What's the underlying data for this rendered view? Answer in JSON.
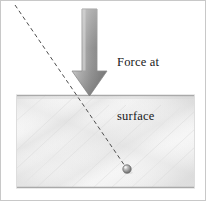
{
  "figure": {
    "width": 201,
    "height": 201,
    "background_color": "#ffffff",
    "border_color": "#c8c8c8"
  },
  "labels": {
    "force_label_line1": "Force at",
    "force_label_line2": "surface",
    "force_label_full": "Force at surface",
    "text_color": "#18181a"
  },
  "arrow": {
    "name": "force-arrow",
    "direction": "down",
    "color_light": "#b8b8b8",
    "color_dark": "#6e6e6e",
    "outline_color": "#8a8a8a",
    "shaft_left": 81,
    "shaft_right": 96,
    "shaft_top": 8,
    "head_top": 70,
    "head_left": 71,
    "head_right": 106,
    "tip_x": 88.5,
    "tip_y": 95
  },
  "block": {
    "name": "material-block",
    "left": 15,
    "top": 94,
    "right": 194,
    "bottom": 187,
    "fill_light": "#fbfbfb",
    "fill_mid": "#ececec",
    "fill_shadow": "#e0e0e0",
    "edge_color": "#a9a9a9",
    "surface_label": "surface"
  },
  "trajectory": {
    "name": "trajectory-dashed-line",
    "color": "#4d4d4d",
    "dash": "4 3",
    "stroke_width": 1,
    "start_x": 14,
    "start_y": 4,
    "end_x": 126,
    "end_y": 168
  },
  "particle": {
    "name": "embedded-particle",
    "center_x": 126,
    "center_y": 168,
    "radius": 4.2,
    "fill_color": "#9a9a9a",
    "highlight_color": "#e8e8e8",
    "outline_color": "#5f5f5f"
  }
}
